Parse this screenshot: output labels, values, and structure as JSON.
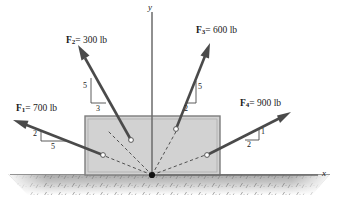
{
  "figure": {
    "axes": {
      "x_label": "x",
      "y_label": "y"
    },
    "colors": {
      "arrow": "#4a4a4a",
      "block_fill": "#d2d2d2",
      "block_border": "#808080",
      "ground": "#b8b8b8",
      "text": "#1a1a1a",
      "dashed": "#3a3a3a"
    },
    "origin_marker": "origin-dot",
    "forces": [
      {
        "id": "F1",
        "name": "F",
        "subscript": "1",
        "equals": "=",
        "magnitude": "700 lb",
        "label": "F₁ = 700 lb",
        "slope_vertical": "2",
        "slope_horizontal": "5",
        "direction": "up-left"
      },
      {
        "id": "F2",
        "name": "F",
        "subscript": "2",
        "equals": "=",
        "magnitude": "300 lb",
        "label": "F₂ = 300 lb",
        "slope_vertical": "5",
        "slope_horizontal": "3",
        "direction": "up-left"
      },
      {
        "id": "F3",
        "name": "F",
        "subscript": "3",
        "equals": "=",
        "magnitude": "600 lb",
        "label": "F₃ = 600 lb",
        "slope_vertical": "5",
        "slope_horizontal": "2",
        "direction": "up-right"
      },
      {
        "id": "F4",
        "name": "F",
        "subscript": "4",
        "equals": "=",
        "magnitude": "900 lb",
        "label": "F₄ = 900 lb",
        "slope_vertical": "1",
        "slope_horizontal": "2",
        "direction": "up-right"
      }
    ]
  }
}
